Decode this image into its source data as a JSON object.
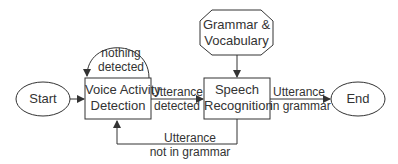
{
  "diagram": {
    "type": "state-flow",
    "nodes": {
      "start": {
        "label": "Start",
        "shape": "ellipse"
      },
      "vad": {
        "label_line1": "Voice Activity",
        "label_line2": "Detection",
        "shape": "rectangle"
      },
      "sr": {
        "label_line1": "Speech",
        "label_line2": "Recognition",
        "shape": "rectangle"
      },
      "grammar": {
        "label_line1": "Grammar &",
        "label_line2": "Vocabulary",
        "shape": "octagon"
      },
      "end": {
        "label": "End",
        "shape": "ellipse"
      }
    },
    "edges": {
      "loop": {
        "line1": "nothing",
        "line2": "detected",
        "from": "vad",
        "to": "vad"
      },
      "detected": {
        "line1": "Utterance",
        "line2": "detected",
        "from": "vad",
        "to": "sr"
      },
      "in_grammar": {
        "line1": "Utterance",
        "line2": "in grammar",
        "from": "sr",
        "to": "end"
      },
      "not_in_grammar": {
        "line1": "Utterance",
        "line2": "not in grammar",
        "from": "sr",
        "to": "vad"
      },
      "start_to_vad": {
        "from": "start",
        "to": "vad"
      },
      "grammar_to_sr": {
        "from": "grammar",
        "to": "sr"
      }
    },
    "colors": {
      "stroke": "#333333",
      "text": "#333333",
      "background": "#ffffff"
    }
  }
}
